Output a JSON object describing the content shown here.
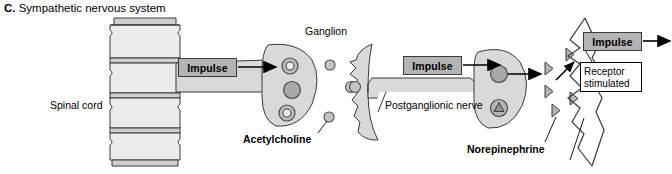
{
  "figure": {
    "panel_letter": "C.",
    "title": " Sympathetic nervous system",
    "full_title": "C. Sympathetic nervous system",
    "type": "anatomical-pathway-diagram"
  },
  "labels": {
    "spinal_cord": "Spinal cord",
    "ganglion": "Ganglion",
    "acetylcholine": "Acetylcholine",
    "postganglionic_nerve": "Postganglionic nerve",
    "norepinephrine": "Norepinephrine"
  },
  "boxes": {
    "impulse_1": "Impulse",
    "impulse_2": "Impulse",
    "impulse_3": "Impulse",
    "receptor_line1": "Receptor",
    "receptor_line2": "stimulated"
  },
  "colors": {
    "background": "#ffffff",
    "outline": "#3a3a3a",
    "tissue_fill": "#d9d9d9",
    "tissue_fill_light": "#ebebeb",
    "impulse_box_fill": "#b4b4b4",
    "vesicle_fill": "#b0b0b0",
    "nucleus_fill": "#a0a0a0",
    "receptor_box_fill": "#ffffff",
    "text": "#000000"
  },
  "structures": [
    {
      "name": "spinal-cord",
      "shape": "stacked vertebral segments",
      "count": 4
    },
    {
      "name": "preganglionic-axon",
      "shape": "tapered horizontal band"
    },
    {
      "name": "ganglion-cell-body",
      "shape": "teardrop",
      "inclusions": [
        "ring",
        "solid nucleus",
        "ring"
      ]
    },
    {
      "name": "acetylcholine-vesicles",
      "shape": "small circles",
      "count": 3
    },
    {
      "name": "postganglionic-dendrite",
      "shape": "crescent / wavy membrane"
    },
    {
      "name": "postganglionic-axon",
      "shape": "tapered horizontal band"
    },
    {
      "name": "nerve-terminal-bulb",
      "shape": "bulb",
      "inclusions": [
        "solid circle",
        "circle with triangle"
      ]
    },
    {
      "name": "norepinephrine-vesicles",
      "shape": "triangles",
      "count": 5
    },
    {
      "name": "target-cell-membrane",
      "shape": "jagged zigzag outline"
    }
  ]
}
